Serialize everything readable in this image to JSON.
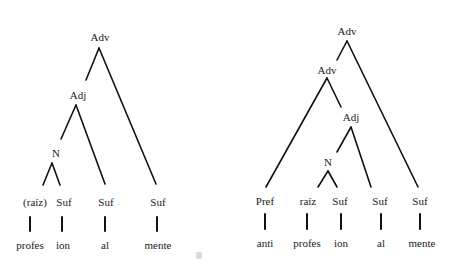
{
  "diagram": {
    "type": "morphological-tree",
    "line_color": "#111111",
    "trees": [
      {
        "id": "profesionalmente",
        "nodes": {
          "root": "Adv",
          "adj": "Adj",
          "n": "N"
        },
        "morph_labels": [
          "(raíz)",
          "Suf",
          "Suf",
          "Suf"
        ],
        "morphemes": [
          "profes",
          "ion",
          "al",
          "mente"
        ]
      },
      {
        "id": "antiprofesionalmente",
        "nodes": {
          "root": "Adv",
          "adv2": "Adv",
          "adj": "Adj",
          "n": "N"
        },
        "morph_labels": [
          "Pref",
          "raíz",
          "Suf",
          "Suf",
          "Suf"
        ],
        "morphemes": [
          "anti",
          "profes",
          "ion",
          "al",
          "mente"
        ]
      }
    ]
  }
}
